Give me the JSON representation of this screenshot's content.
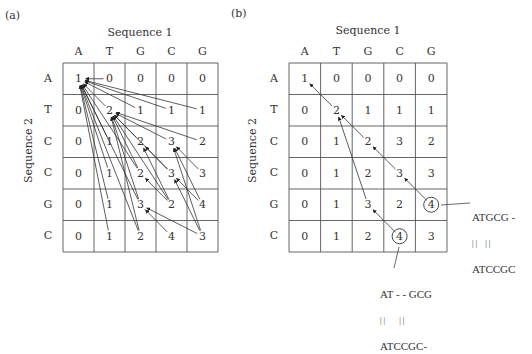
{
  "panels": [
    {
      "label": "(a)",
      "seq1_label": "Sequence 1",
      "seq2_label": "Sequence 2",
      "seq1": [
        "A",
        "T",
        "G",
        "C",
        "G"
      ],
      "seq2": [
        "A",
        "T",
        "C",
        "C",
        "G",
        "C"
      ],
      "matrix": [
        [
          1,
          0,
          0,
          0,
          0
        ],
        [
          0,
          2,
          1,
          1,
          1
        ],
        [
          0,
          1,
          2,
          3,
          2
        ],
        [
          0,
          1,
          2,
          3,
          3
        ],
        [
          0,
          1,
          3,
          2,
          4
        ],
        [
          0,
          1,
          2,
          4,
          3
        ]
      ],
      "arrows": [
        [
          [
            0,
            1
          ],
          [
            0,
            0
          ]
        ],
        [
          [
            1,
            2
          ],
          [
            0,
            0
          ]
        ],
        [
          [
            1,
            3
          ],
          [
            0,
            0
          ]
        ],
        [
          [
            1,
            4
          ],
          [
            0,
            0
          ]
        ],
        [
          [
            1,
            1
          ],
          [
            0,
            0
          ]
        ],
        [
          [
            2,
            1
          ],
          [
            0,
            0
          ]
        ],
        [
          [
            3,
            1
          ],
          [
            0,
            0
          ]
        ],
        [
          [
            4,
            1
          ],
          [
            0,
            0
          ]
        ],
        [
          [
            5,
            1
          ],
          [
            0,
            0
          ]
        ],
        [
          [
            3,
            2
          ],
          [
            0,
            0
          ]
        ],
        [
          [
            4,
            2
          ],
          [
            0,
            0
          ]
        ],
        [
          [
            5,
            2
          ],
          [
            0,
            0
          ]
        ],
        [
          [
            2,
            2
          ],
          [
            1,
            1
          ]
        ],
        [
          [
            2,
            3
          ],
          [
            1,
            1
          ]
        ],
        [
          [
            2,
            4
          ],
          [
            1,
            1
          ]
        ],
        [
          [
            3,
            2
          ],
          [
            1,
            1
          ]
        ],
        [
          [
            3,
            3
          ],
          [
            1,
            1
          ]
        ],
        [
          [
            4,
            2
          ],
          [
            1,
            1
          ]
        ],
        [
          [
            4,
            3
          ],
          [
            1,
            1
          ]
        ],
        [
          [
            5,
            2
          ],
          [
            1,
            1
          ]
        ],
        [
          [
            3,
            3
          ],
          [
            2,
            2
          ]
        ],
        [
          [
            3,
            4
          ],
          [
            2,
            3
          ]
        ],
        [
          [
            4,
            3
          ],
          [
            3,
            2
          ]
        ],
        [
          [
            4,
            3
          ],
          [
            2,
            2
          ]
        ],
        [
          [
            4,
            4
          ],
          [
            3,
            3
          ]
        ],
        [
          [
            4,
            4
          ],
          [
            2,
            3
          ]
        ],
        [
          [
            5,
            4
          ],
          [
            4,
            2
          ]
        ],
        [
          [
            5,
            4
          ],
          [
            3,
            3
          ]
        ],
        [
          [
            5,
            4
          ],
          [
            2,
            3
          ]
        ],
        [
          [
            5,
            3
          ],
          [
            4,
            2
          ]
        ]
      ],
      "circled": []
    },
    {
      "label": "(b)",
      "seq1_label": "Sequence 1",
      "seq2_label": "Sequence 2",
      "seq1": [
        "A",
        "T",
        "G",
        "C",
        "G"
      ],
      "seq2": [
        "A",
        "T",
        "C",
        "C",
        "G",
        "C"
      ],
      "matrix": [
        [
          1,
          0,
          0,
          0,
          0
        ],
        [
          0,
          2,
          1,
          1,
          1
        ],
        [
          0,
          1,
          2,
          3,
          2
        ],
        [
          0,
          1,
          2,
          3,
          3
        ],
        [
          0,
          1,
          3,
          2,
          4
        ],
        [
          0,
          1,
          2,
          4,
          3
        ]
      ],
      "arrows": [
        [
          [
            1,
            1
          ],
          [
            0,
            0
          ]
        ],
        [
          [
            2,
            2
          ],
          [
            1,
            1
          ]
        ],
        [
          [
            3,
            3
          ],
          [
            2,
            2
          ]
        ],
        [
          [
            4,
            4
          ],
          [
            3,
            3
          ]
        ],
        [
          [
            4,
            2
          ],
          [
            1,
            1
          ]
        ],
        [
          [
            5,
            3
          ],
          [
            4,
            2
          ]
        ]
      ],
      "circled": [
        [
          4,
          4
        ],
        [
          5,
          3
        ]
      ],
      "alignments": [
        {
          "top": "ATGCG -",
          "bars": "| |    | |",
          "bottom": "ATCCGC"
        },
        {
          "top": "AT - - GCG",
          "bars": "| |       | |",
          "bottom": "ATCCGC-"
        }
      ]
    }
  ],
  "colors": {
    "line": "#555555",
    "text": "#333333",
    "arrow": "#222222"
  }
}
